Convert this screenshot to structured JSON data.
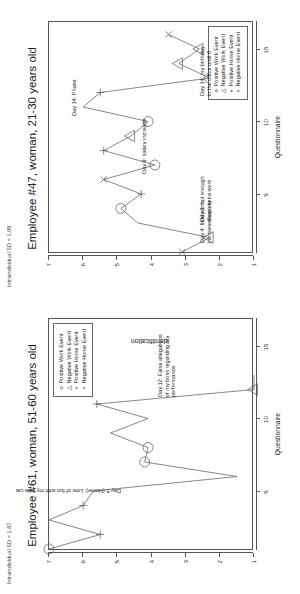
{
  "figure": {
    "orientation": "rotated-90-ccw",
    "background": "#ffffff",
    "line_color": "#555555",
    "text_color": "#222222"
  },
  "panels": [
    {
      "id": "panel-employee-61",
      "sd_label": "Intraindividual SD = 1.87",
      "title": "Employee #61, woman, 51-60 years old",
      "legend": {
        "position": "top-right",
        "items": [
          {
            "symbol": "o",
            "label": "Positive Work Event"
          },
          {
            "symbol": "△",
            "label": "Negative Work Event"
          },
          {
            "symbol": "+",
            "label": "Positive Home Event"
          },
          {
            "symbol": "×",
            "label": "Negative Home Event"
          }
        ]
      },
      "annotations": [
        {
          "id": "annot-day5",
          "text": "Day 5 (Home): Lots of fun with my little cat"
        },
        {
          "id": "annot-day12",
          "text": "Day 12: False allegations\nof my boss regarding my\nperformance"
        }
      ],
      "chart_data": {
        "type": "line",
        "title": "Employee #61, woman, 51-60 years old",
        "xlabel": "Questionnaire",
        "ylabel": "Identification",
        "xlim": [
          1,
          17
        ],
        "ylim": [
          1,
          7
        ],
        "xticks": [
          5,
          10,
          15
        ],
        "yticks": [
          1,
          2,
          3,
          4,
          5,
          6,
          7
        ],
        "grid": false,
        "x": [
          1,
          2,
          3,
          4,
          5,
          6,
          7,
          8,
          9,
          10,
          11,
          12,
          13
        ],
        "y": [
          7,
          5.5,
          7,
          6,
          5.7,
          1.5,
          4.2,
          4.1,
          5.2,
          4.1,
          5.6,
          1,
          1
        ],
        "events": [
          {
            "x": 1,
            "y": 7,
            "type": "Positive Work Event",
            "symbol": "o"
          },
          {
            "x": 2,
            "y": 5.5,
            "type": "Positive Home Event",
            "symbol": "+"
          },
          {
            "x": 4,
            "y": 6,
            "type": "Positive Home Event",
            "symbol": "+"
          },
          {
            "x": 7,
            "y": 4.2,
            "type": "Positive Work Event",
            "symbol": "o"
          },
          {
            "x": 8,
            "y": 4.1,
            "type": "Positive Work Event",
            "symbol": "o"
          },
          {
            "x": 11,
            "y": 5.6,
            "type": "Positive Home Event",
            "symbol": "+"
          },
          {
            "x": 12,
            "y": 1,
            "type": "Negative Work Event",
            "symbol": "△"
          }
        ]
      }
    },
    {
      "id": "panel-employee-47",
      "sd_label": "Intraindividual SD = 1.09",
      "title": "Employee #47, woman, 21-30 years old",
      "legend": {
        "position": "bottom-right",
        "items": [
          {
            "symbol": "o",
            "label": "Positive Work Event"
          },
          {
            "symbol": "△",
            "label": "Negative Work Event"
          },
          {
            "symbol": "+",
            "label": "Positive Home Event"
          },
          {
            "symbol": "×",
            "label": "Negative Home Event"
          }
        ]
      },
      "annotations": [
        {
          "id": "annot-day3",
          "text": "Day 3: not enough\nsleep, extra work"
        },
        {
          "id": "annot-day4",
          "text": "Day 4: field work,\nincreased variety"
        },
        {
          "id": "annot-day9",
          "text": "Day 9: salary increase"
        },
        {
          "id": "annot-day14-phase",
          "text": "Day 14: Phase"
        },
        {
          "id": "annot-day14-birthday",
          "text": "Day 14: my birthday\nin the office until 8"
        }
      ],
      "chart_data": {
        "type": "line",
        "title": "Employee #47, woman, 21-30 years old",
        "xlabel": "Questionnaire",
        "ylabel": "Identification",
        "xlim": [
          1,
          17
        ],
        "ylim": [
          1,
          7
        ],
        "xticks": [
          5,
          10,
          15
        ],
        "yticks": [
          1,
          2,
          3,
          4,
          5,
          6,
          7
        ],
        "grid": false,
        "x": [
          1,
          2,
          3,
          4,
          5,
          6,
          7,
          8,
          9,
          10,
          11,
          12,
          13,
          14,
          15,
          16
        ],
        "y": [
          3.1,
          2.3,
          4.4,
          4.9,
          4.3,
          5.4,
          3.9,
          5.4,
          4.6,
          4.1,
          6,
          5.5,
          2.3,
          3.2,
          2.6,
          3.5
        ],
        "events": [
          {
            "x": 1,
            "y": 3.1,
            "type": "Negative Home Event",
            "symbol": "×"
          },
          {
            "x": 2,
            "y": 2.3,
            "type": "Negative Work Event",
            "symbol": "△"
          },
          {
            "x": 4,
            "y": 4.9,
            "type": "Positive Work Event",
            "symbol": "o"
          },
          {
            "x": 5,
            "y": 4.3,
            "type": "Positive Home Event",
            "symbol": "+"
          },
          {
            "x": 6,
            "y": 5.4,
            "type": "Negative Home Event",
            "symbol": "×"
          },
          {
            "x": 7,
            "y": 3.9,
            "type": "Positive Work Event",
            "symbol": "o"
          },
          {
            "x": 8,
            "y": 5.4,
            "type": "Positive Home Event",
            "symbol": "+"
          },
          {
            "x": 9,
            "y": 4.6,
            "type": "Negative Work Event",
            "symbol": "△"
          },
          {
            "x": 10,
            "y": 4.1,
            "type": "Positive Work Event",
            "symbol": "o"
          },
          {
            "x": 12,
            "y": 5.5,
            "type": "Positive Home Event",
            "symbol": "+"
          },
          {
            "x": 13,
            "y": 2.3,
            "type": "Positive Work Event",
            "symbol": "o"
          },
          {
            "x": 14,
            "y": 3.2,
            "type": "Negative Work Event",
            "symbol": "△"
          },
          {
            "x": 15,
            "y": 2.6,
            "type": "Negative Work Event",
            "symbol": "△"
          },
          {
            "x": 16,
            "y": 3.5,
            "type": "Negative Home Event",
            "symbol": "×"
          }
        ]
      }
    }
  ]
}
